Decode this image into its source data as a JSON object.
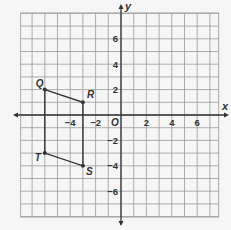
{
  "graph": {
    "axes": {
      "x_label": "x",
      "y_label": "y",
      "origin_label": "O",
      "x_ticks": [
        {
          "value": -4,
          "label": "−4"
        },
        {
          "value": -2,
          "label": "−2"
        },
        {
          "value": 2,
          "label": "2"
        },
        {
          "value": 4,
          "label": "4"
        },
        {
          "value": 6,
          "label": "6"
        }
      ],
      "y_ticks": [
        {
          "value": 6,
          "label": "6"
        },
        {
          "value": 4,
          "label": "4"
        },
        {
          "value": 2,
          "label": "2"
        },
        {
          "value": -2,
          "label": "−2"
        },
        {
          "value": -4,
          "label": "−4"
        },
        {
          "value": -6,
          "label": "−6"
        }
      ],
      "x_range": [
        -8,
        8
      ],
      "y_range": [
        -8,
        8
      ]
    },
    "polygon": {
      "name": "QRST",
      "vertices": [
        {
          "label": "Q",
          "x": -6,
          "y": 2
        },
        {
          "label": "R",
          "x": -3,
          "y": 1
        },
        {
          "label": "S",
          "x": -3,
          "y": -4
        },
        {
          "label": "T",
          "x": -6,
          "y": -3
        }
      ]
    },
    "colors": {
      "grid": "#9a9a9a",
      "axis": "#333333",
      "figure": "#333333",
      "background": "#f6f6f6"
    }
  }
}
